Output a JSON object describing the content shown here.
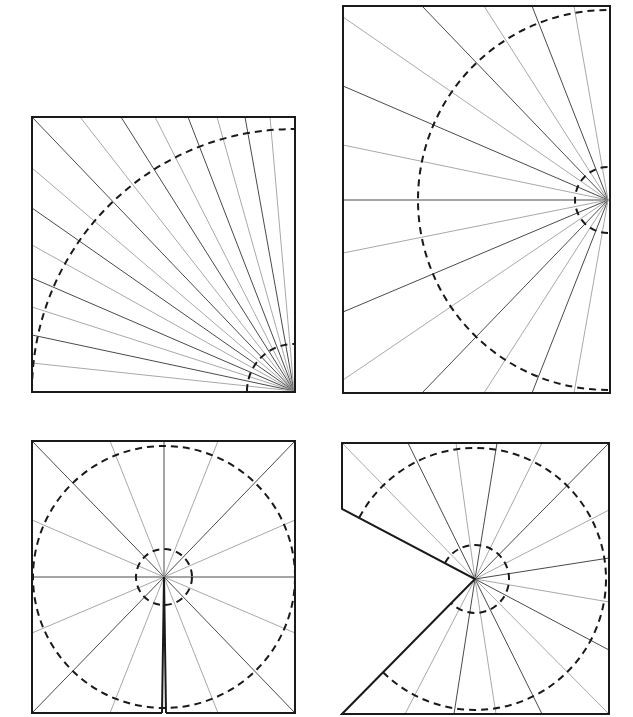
{
  "colors": {
    "frame": "#1a1a1a",
    "ray_dark": "#4a4a4a",
    "ray_light": "#a8a8a8",
    "circle": "#1a1a1a",
    "background": "#ffffff"
  },
  "diagrams": [
    {
      "id": "quarter-fan",
      "name": "Square with rays from bottom-right corner",
      "outline": [
        [
          32,
          117
        ],
        [
          295,
          117
        ],
        [
          295,
          392
        ],
        [
          32,
          392
        ]
      ],
      "apex": [
        294,
        391
      ],
      "rays": [
        {
          "to": [
            32,
            117
          ],
          "tone": "dark"
        },
        {
          "to": [
            80,
            117
          ],
          "tone": "light"
        },
        {
          "to": [
            121,
            117
          ],
          "tone": "dark"
        },
        {
          "to": [
            155,
            117
          ],
          "tone": "light"
        },
        {
          "to": [
            188,
            117
          ],
          "tone": "dark"
        },
        {
          "to": [
            217,
            117
          ],
          "tone": "light"
        },
        {
          "to": [
            245,
            117
          ],
          "tone": "dark"
        },
        {
          "to": [
            270,
            117
          ],
          "tone": "light"
        },
        {
          "to": [
            32,
            168
          ],
          "tone": "light"
        },
        {
          "to": [
            32,
            208
          ],
          "tone": "dark"
        },
        {
          "to": [
            32,
            245
          ],
          "tone": "light"
        },
        {
          "to": [
            32,
            278
          ],
          "tone": "dark"
        },
        {
          "to": [
            32,
            307
          ],
          "tone": "light"
        },
        {
          "to": [
            32,
            335
          ],
          "tone": "dark"
        },
        {
          "to": [
            32,
            363
          ],
          "tone": "light"
        }
      ],
      "circles": [
        {
          "r": 262,
          "start": 180,
          "end": 270
        },
        {
          "r": 47,
          "start": 180,
          "end": 270
        }
      ]
    },
    {
      "id": "half-fan",
      "name": "Tall rectangle with rays from right-edge midpoint",
      "outline": [
        [
          343,
          6
        ],
        [
          610,
          6
        ],
        [
          610,
          393
        ],
        [
          343,
          393
        ]
      ],
      "apex": [
        608,
        200
      ],
      "rays": [
        {
          "to": [
            422,
            6
          ],
          "tone": "dark"
        },
        {
          "to": [
            484,
            6
          ],
          "tone": "light"
        },
        {
          "to": [
            532,
            6
          ],
          "tone": "dark"
        },
        {
          "to": [
            574,
            6
          ],
          "tone": "light"
        },
        {
          "to": [
            343,
            17
          ],
          "tone": "light"
        },
        {
          "to": [
            343,
            86
          ],
          "tone": "dark"
        },
        {
          "to": [
            343,
            145
          ],
          "tone": "light"
        },
        {
          "to": [
            343,
            200
          ],
          "tone": "dark"
        },
        {
          "to": [
            343,
            253
          ],
          "tone": "light"
        },
        {
          "to": [
            343,
            312
          ],
          "tone": "dark"
        },
        {
          "to": [
            343,
            380
          ],
          "tone": "light"
        },
        {
          "to": [
            422,
            393
          ],
          "tone": "dark"
        },
        {
          "to": [
            484,
            393
          ],
          "tone": "light"
        },
        {
          "to": [
            532,
            393
          ],
          "tone": "dark"
        },
        {
          "to": [
            574,
            393
          ],
          "tone": "light"
        }
      ],
      "circles": [
        {
          "r": 190,
          "start": 90,
          "end": 270
        },
        {
          "r": 33,
          "start": 90,
          "end": 270
        }
      ]
    },
    {
      "id": "full-fan-slit",
      "name": "Square with full fan from center and slit to bottom edge",
      "outline": [
        [
          162,
          713
        ],
        [
          32,
          713
        ],
        [
          32,
          441
        ],
        [
          295,
          441
        ],
        [
          295,
          713
        ],
        [
          166,
          713
        ]
      ],
      "apex": [
        164,
        577
      ],
      "rays": [
        {
          "to": [
            32,
            441
          ],
          "tone": "dark"
        },
        {
          "to": [
            110,
            441
          ],
          "tone": "light"
        },
        {
          "to": [
            164,
            441
          ],
          "tone": "dark"
        },
        {
          "to": [
            218,
            441
          ],
          "tone": "light"
        },
        {
          "to": [
            295,
            441
          ],
          "tone": "dark"
        },
        {
          "to": [
            295,
            520
          ],
          "tone": "light"
        },
        {
          "to": [
            295,
            577
          ],
          "tone": "dark"
        },
        {
          "to": [
            295,
            633
          ],
          "tone": "light"
        },
        {
          "to": [
            295,
            713
          ],
          "tone": "dark"
        },
        {
          "to": [
            218,
            713
          ],
          "tone": "light"
        },
        {
          "to": [
            110,
            713
          ],
          "tone": "light"
        },
        {
          "to": [
            32,
            713
          ],
          "tone": "dark"
        },
        {
          "to": [
            32,
            633
          ],
          "tone": "light"
        },
        {
          "to": [
            32,
            577
          ],
          "tone": "dark"
        },
        {
          "to": [
            32,
            520
          ],
          "tone": "light"
        },
        {
          "to": [
            162,
            713
          ],
          "tone": "cut"
        },
        {
          "to": [
            166,
            713
          ],
          "tone": "cut"
        }
      ],
      "circles": [
        {
          "r": 131,
          "start": 0,
          "end": 360
        },
        {
          "r": 28,
          "start": 0,
          "end": 360
        }
      ]
    },
    {
      "id": "fan-wedge-removed",
      "name": "Square with wedge cut from left side and fan from center",
      "outline": [
        [
          342,
          443
        ],
        [
          609,
          443
        ],
        [
          609,
          714
        ],
        [
          342,
          714
        ],
        [
          475,
          579
        ],
        [
          342,
          509
        ]
      ],
      "apex": [
        475,
        579
      ],
      "rays": [
        {
          "to": [
            342,
            443
          ],
          "tone": "light"
        },
        {
          "to": [
            408,
            443
          ],
          "tone": "dark"
        },
        {
          "to": [
            456,
            443
          ],
          "tone": "light"
        },
        {
          "to": [
            497,
            443
          ],
          "tone": "dark"
        },
        {
          "to": [
            542,
            443
          ],
          "tone": "light"
        },
        {
          "to": [
            609,
            443
          ],
          "tone": "dark"
        },
        {
          "to": [
            609,
            510
          ],
          "tone": "light"
        },
        {
          "to": [
            609,
            558
          ],
          "tone": "dark"
        },
        {
          "to": [
            609,
            602
          ],
          "tone": "light"
        },
        {
          "to": [
            609,
            650
          ],
          "tone": "dark"
        },
        {
          "to": [
            609,
            714
          ],
          "tone": "light"
        },
        {
          "to": [
            542,
            714
          ],
          "tone": "dark"
        },
        {
          "to": [
            496,
            714
          ],
          "tone": "light"
        },
        {
          "to": [
            454,
            714
          ],
          "tone": "dark"
        },
        {
          "to": [
            405,
            714
          ],
          "tone": "light"
        }
      ],
      "circles": [
        {
          "r": 131,
          "start": -152,
          "end": 135
        },
        {
          "r": 34,
          "start": -152,
          "end": 135
        }
      ]
    }
  ]
}
